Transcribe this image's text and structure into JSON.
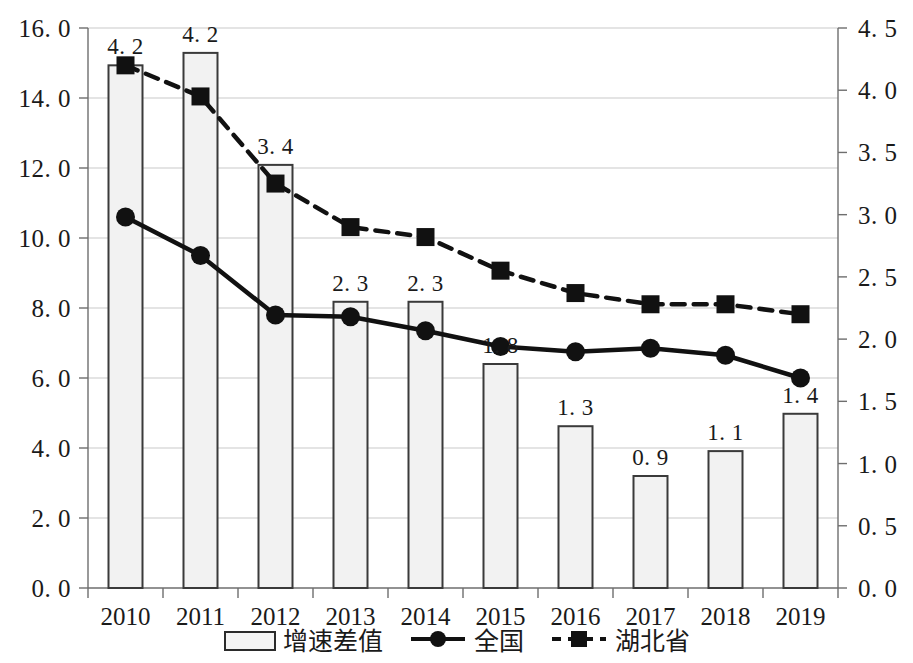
{
  "chart_data": {
    "type": "bar",
    "title": "",
    "subtitle": "",
    "xlabel": "",
    "ylabel": "",
    "grid": true,
    "legend_position": "bottom",
    "categories": [
      "2010",
      "2011",
      "2012",
      "2013",
      "2014",
      "2015",
      "2016",
      "2017",
      "2018",
      "2019"
    ],
    "left_axis": {
      "ylim": [
        0.0,
        16.0
      ],
      "ticks": [
        0.0,
        2.0,
        4.0,
        6.0,
        8.0,
        10.0,
        12.0,
        14.0,
        16.0
      ],
      "tick_labels": [
        "0. 0",
        "2. 0",
        "4. 0",
        "6. 0",
        "8. 0",
        "10. 0",
        "12. 0",
        "14. 0",
        "16. 0"
      ]
    },
    "right_axis": {
      "ylim": [
        0.0,
        4.5
      ],
      "ticks": [
        0.0,
        0.5,
        1.0,
        1.5,
        2.0,
        2.5,
        3.0,
        3.5,
        4.0,
        4.5
      ],
      "tick_labels": [
        "0. 0",
        "0. 5",
        "1. 0",
        "1. 5",
        "2. 0",
        "2. 5",
        "3. 0",
        "3. 5",
        "4. 0",
        "4. 5"
      ]
    },
    "series": [
      {
        "name": "增速差值",
        "type": "bar",
        "axis": "right",
        "values": [
          4.2,
          4.3,
          3.4,
          2.3,
          2.3,
          1.8,
          1.3,
          0.9,
          1.1,
          1.4
        ],
        "data_labels": [
          "4. 2",
          "4. 2",
          "3. 4",
          "2. 3",
          "2. 3",
          "1. 8",
          "1. 3",
          "0. 9",
          "1. 1",
          "1. 4"
        ]
      },
      {
        "name": "全国",
        "type": "line",
        "axis": "left",
        "marker": "circle",
        "linestyle": "solid",
        "values": [
          10.6,
          9.5,
          7.8,
          7.75,
          7.35,
          6.9,
          6.75,
          6.85,
          6.65,
          6.0
        ]
      },
      {
        "name": "湖北省",
        "type": "line",
        "axis": "right",
        "marker": "square",
        "linestyle": "dashed",
        "values": [
          4.2,
          3.95,
          3.25,
          2.9,
          2.82,
          2.55,
          2.37,
          2.28,
          2.28,
          2.2
        ]
      }
    ],
    "colors": {
      "bar_fill": "#f2f2f2",
      "bar_stroke": "#3a3a3a",
      "line_national": "#111111",
      "line_hubei": "#111111",
      "grid": "#c9c9c9",
      "axis": "#6e6e6e",
      "text": "#1a1a1a"
    }
  },
  "legend": {
    "items": [
      {
        "label": "增速差值",
        "marker": "bar-swatch"
      },
      {
        "label": "全国",
        "marker": "circle-solid-line"
      },
      {
        "label": "湖北省",
        "marker": "square-dashed-line"
      }
    ]
  }
}
